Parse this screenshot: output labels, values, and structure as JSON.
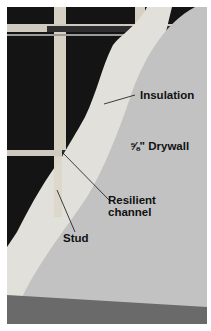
{
  "figure": {
    "labels": {
      "insulation": "Insulation",
      "drywall": "⅝\" Drywall",
      "resilient_line1": "Resilient",
      "resilient_line2": "channel",
      "stud": "Stud"
    },
    "colors": {
      "drywall": "#c4c4c4",
      "insulation": "#e4e2dc",
      "stud": "#d8d2c4",
      "cavity": "#141414",
      "channel": "#3a3a3a",
      "floor": "#6e6e6e"
    }
  }
}
